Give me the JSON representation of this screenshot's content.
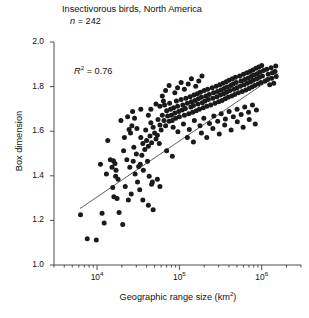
{
  "figure": {
    "title": "Insectivorous birds, North America",
    "sample_size_symbol": "n",
    "sample_size_text": "= 242",
    "annotation_symbol": "R",
    "annotation_exponent": "2",
    "annotation_value": "= 0.76",
    "marker_color": "#1a1a1a",
    "line_color": "#4d4d4d",
    "axis_color": "#4d4d4d"
  },
  "chart_data": {
    "type": "scatter",
    "title": "Insectivorous birds, North America",
    "subtitle": "n = 242",
    "xlabel": "Geographic range size (km2)",
    "ylabel": "Box dimension",
    "xscale": "log",
    "yscale": "linear",
    "xlim": [
      3000,
      3000000
    ],
    "ylim": [
      1.0,
      2.0
    ],
    "xticks": [
      10000,
      100000,
      1000000
    ],
    "xtick_labels": [
      "10⁴",
      "10⁵",
      "10⁶"
    ],
    "yticks": [
      1.0,
      1.2,
      1.4,
      1.6,
      1.8,
      2.0
    ],
    "ytick_labels": [
      "1.0",
      "1.2",
      "1.4",
      "1.6",
      "1.8",
      "2.0"
    ],
    "grid": false,
    "legend": false,
    "n_points": 242,
    "r_squared": 0.76,
    "annotations": [
      {
        "text": "R2 = 0.76",
        "x": 14000,
        "y": 1.88
      }
    ],
    "fit_line": {
      "type": "linear-on-log-x",
      "x_start": 6200,
      "y_start": 1.253,
      "x_end": 1600000,
      "y_end": 1.858
    },
    "points": [
      [
        6300,
        1.225
      ],
      [
        7600,
        1.118
      ],
      [
        11500,
        1.232
      ],
      [
        12200,
        1.188
      ],
      [
        13000,
        1.408
      ],
      [
        18500,
        1.235
      ],
      [
        20500,
        1.182
      ],
      [
        9800,
        1.112
      ],
      [
        15500,
        1.348
      ],
      [
        11000,
        1.452
      ],
      [
        16000,
        1.306
      ],
      [
        17500,
        1.298
      ],
      [
        14500,
        1.472
      ],
      [
        15800,
        1.468
      ],
      [
        16500,
        1.455
      ],
      [
        15200,
        1.438
      ],
      [
        17000,
        1.425
      ],
      [
        16800,
        1.398
      ],
      [
        18000,
        1.385
      ],
      [
        21000,
        1.512
      ],
      [
        23000,
        1.472
      ],
      [
        25000,
        1.438
      ],
      [
        22000,
        1.352
      ],
      [
        26000,
        1.318
      ],
      [
        24000,
        1.292
      ],
      [
        28000,
        1.528
      ],
      [
        30000,
        1.498
      ],
      [
        27500,
        1.465
      ],
      [
        32000,
        1.442
      ],
      [
        29000,
        1.408
      ],
      [
        31000,
        1.372
      ],
      [
        33000,
        1.338
      ],
      [
        26500,
        1.625
      ],
      [
        28500,
        1.658
      ],
      [
        30500,
        1.612
      ],
      [
        25500,
        1.592
      ],
      [
        34000,
        1.572
      ],
      [
        36000,
        1.545
      ],
      [
        38000,
        1.518
      ],
      [
        35000,
        1.492
      ],
      [
        40000,
        1.558
      ],
      [
        42000,
        1.532
      ],
      [
        39000,
        1.605
      ],
      [
        44000,
        1.578
      ],
      [
        46000,
        1.548
      ],
      [
        41000,
        1.465
      ],
      [
        48000,
        1.618
      ],
      [
        50000,
        1.592
      ],
      [
        45000,
        1.638
      ],
      [
        52000,
        1.565
      ],
      [
        21500,
        1.572
      ],
      [
        19500,
        1.648
      ],
      [
        23500,
        1.665
      ],
      [
        27000,
        1.688
      ],
      [
        33500,
        1.452
      ],
      [
        36500,
        1.425
      ],
      [
        43000,
        1.398
      ],
      [
        47000,
        1.372
      ],
      [
        55000,
        1.652
      ],
      [
        58000,
        1.628
      ],
      [
        60000,
        1.605
      ],
      [
        54000,
        1.582
      ],
      [
        62000,
        1.672
      ],
      [
        65000,
        1.648
      ],
      [
        68000,
        1.625
      ],
      [
        57000,
        1.545
      ],
      [
        70000,
        1.692
      ],
      [
        72000,
        1.668
      ],
      [
        66000,
        1.718
      ],
      [
        75000,
        1.645
      ],
      [
        78000,
        1.698
      ],
      [
        80000,
        1.672
      ],
      [
        82000,
        1.648
      ],
      [
        76000,
        1.725
      ],
      [
        85000,
        1.705
      ],
      [
        88000,
        1.682
      ],
      [
        90000,
        1.658
      ],
      [
        92000,
        1.735
      ],
      [
        95000,
        1.712
      ],
      [
        98000,
        1.688
      ],
      [
        100000,
        1.665
      ],
      [
        105000,
        1.742
      ],
      [
        110000,
        1.718
      ],
      [
        108000,
        1.695
      ],
      [
        115000,
        1.672
      ],
      [
        120000,
        1.748
      ],
      [
        125000,
        1.725
      ],
      [
        118000,
        1.702
      ],
      [
        130000,
        1.678
      ],
      [
        135000,
        1.755
      ],
      [
        140000,
        1.732
      ],
      [
        138000,
        1.708
      ],
      [
        145000,
        1.685
      ],
      [
        150000,
        1.762
      ],
      [
        155000,
        1.738
      ],
      [
        148000,
        1.715
      ],
      [
        160000,
        1.692
      ],
      [
        165000,
        1.768
      ],
      [
        170000,
        1.745
      ],
      [
        168000,
        1.722
      ],
      [
        175000,
        1.698
      ],
      [
        180000,
        1.775
      ],
      [
        185000,
        1.752
      ],
      [
        190000,
        1.728
      ],
      [
        195000,
        1.705
      ],
      [
        200000,
        1.782
      ],
      [
        210000,
        1.758
      ],
      [
        205000,
        1.735
      ],
      [
        215000,
        1.712
      ],
      [
        220000,
        1.788
      ],
      [
        230000,
        1.765
      ],
      [
        225000,
        1.742
      ],
      [
        240000,
        1.718
      ],
      [
        250000,
        1.795
      ],
      [
        260000,
        1.772
      ],
      [
        255000,
        1.748
      ],
      [
        270000,
        1.725
      ],
      [
        280000,
        1.802
      ],
      [
        290000,
        1.778
      ],
      [
        285000,
        1.755
      ],
      [
        300000,
        1.732
      ],
      [
        310000,
        1.808
      ],
      [
        320000,
        1.785
      ],
      [
        315000,
        1.762
      ],
      [
        330000,
        1.738
      ],
      [
        340000,
        1.815
      ],
      [
        350000,
        1.792
      ],
      [
        345000,
        1.768
      ],
      [
        360000,
        1.745
      ],
      [
        370000,
        1.822
      ],
      [
        380000,
        1.798
      ],
      [
        375000,
        1.775
      ],
      [
        390000,
        1.752
      ],
      [
        400000,
        1.828
      ],
      [
        420000,
        1.805
      ],
      [
        410000,
        1.782
      ],
      [
        430000,
        1.758
      ],
      [
        440000,
        1.835
      ],
      [
        450000,
        1.812
      ],
      [
        460000,
        1.788
      ],
      [
        470000,
        1.765
      ],
      [
        480000,
        1.842
      ],
      [
        490000,
        1.818
      ],
      [
        500000,
        1.795
      ],
      [
        520000,
        1.772
      ],
      [
        540000,
        1.848
      ],
      [
        560000,
        1.825
      ],
      [
        550000,
        1.802
      ],
      [
        580000,
        1.778
      ],
      [
        600000,
        1.855
      ],
      [
        620000,
        1.832
      ],
      [
        610000,
        1.808
      ],
      [
        640000,
        1.785
      ],
      [
        660000,
        1.862
      ],
      [
        680000,
        1.838
      ],
      [
        670000,
        1.815
      ],
      [
        700000,
        1.792
      ],
      [
        720000,
        1.868
      ],
      [
        740000,
        1.845
      ],
      [
        730000,
        1.822
      ],
      [
        760000,
        1.798
      ],
      [
        780000,
        1.875
      ],
      [
        800000,
        1.852
      ],
      [
        790000,
        1.828
      ],
      [
        820000,
        1.805
      ],
      [
        850000,
        1.882
      ],
      [
        880000,
        1.858
      ],
      [
        870000,
        1.835
      ],
      [
        900000,
        1.812
      ],
      [
        920000,
        1.888
      ],
      [
        950000,
        1.865
      ],
      [
        940000,
        1.842
      ],
      [
        980000,
        1.818
      ],
      [
        1000000,
        1.895
      ],
      [
        1050000,
        1.872
      ],
      [
        1020000,
        1.848
      ],
      [
        1100000,
        1.825
      ],
      [
        1150000,
        1.878
      ],
      [
        1200000,
        1.855
      ],
      [
        1180000,
        1.832
      ],
      [
        1250000,
        1.808
      ],
      [
        1300000,
        1.885
      ],
      [
        1350000,
        1.862
      ],
      [
        1320000,
        1.838
      ],
      [
        1400000,
        1.815
      ],
      [
        1450000,
        1.868
      ],
      [
        1500000,
        1.845
      ],
      [
        1480000,
        1.892
      ],
      [
        62000,
        1.758
      ],
      [
        68000,
        1.782
      ],
      [
        75000,
        1.805
      ],
      [
        88000,
        1.772
      ],
      [
        95000,
        1.795
      ],
      [
        105000,
        1.818
      ],
      [
        115000,
        1.788
      ],
      [
        128000,
        1.812
      ],
      [
        140000,
        1.835
      ],
      [
        158000,
        1.802
      ],
      [
        172000,
        1.825
      ],
      [
        188000,
        1.848
      ],
      [
        45000,
        1.698
      ],
      [
        52000,
        1.722
      ],
      [
        58000,
        1.712
      ],
      [
        64000,
        1.735
      ],
      [
        84000,
        1.618
      ],
      [
        96000,
        1.598
      ],
      [
        112000,
        1.632
      ],
      [
        132000,
        1.608
      ],
      [
        152000,
        1.648
      ],
      [
        178000,
        1.625
      ],
      [
        198000,
        1.658
      ],
      [
        232000,
        1.635
      ],
      [
        262000,
        1.668
      ],
      [
        292000,
        1.645
      ],
      [
        322000,
        1.678
      ],
      [
        362000,
        1.655
      ],
      [
        402000,
        1.688
      ],
      [
        452000,
        1.665
      ],
      [
        502000,
        1.698
      ],
      [
        562000,
        1.675
      ],
      [
        622000,
        1.708
      ],
      [
        692000,
        1.685
      ],
      [
        772000,
        1.718
      ],
      [
        862000,
        1.695
      ],
      [
        36000,
        1.292
      ],
      [
        42000,
        1.268
      ],
      [
        48000,
        1.248
      ],
      [
        58000,
        1.352
      ],
      [
        70000,
        1.512
      ],
      [
        82000,
        1.488
      ],
      [
        46000,
        1.362
      ],
      [
        54000,
        1.385
      ],
      [
        125000,
        1.572
      ],
      [
        148000,
        1.552
      ],
      [
        185000,
        1.592
      ],
      [
        215000,
        1.572
      ],
      [
        255000,
        1.612
      ],
      [
        305000,
        1.588
      ],
      [
        355000,
        1.628
      ],
      [
        425000,
        1.605
      ],
      [
        505000,
        1.642
      ],
      [
        595000,
        1.618
      ],
      [
        705000,
        1.652
      ],
      [
        835000,
        1.632
      ],
      [
        42000,
        1.672
      ],
      [
        34000,
        1.698
      ],
      [
        13500,
        1.558
      ],
      [
        24500,
        1.608
      ]
    ]
  }
}
